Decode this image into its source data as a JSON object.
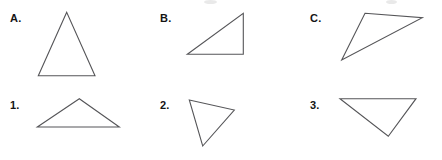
{
  "page": {
    "background_color": "#ffffff",
    "width": 442,
    "height": 160
  },
  "style": {
    "stroke_color": "#555558",
    "label_color": "#141414",
    "stroke_width": 1.1
  },
  "labels": {
    "a": "A.",
    "b": "B.",
    "c": "C.",
    "one": "1.",
    "two": "2.",
    "three": "3."
  },
  "figures": [
    {
      "id": "A",
      "label": "A.",
      "label_pos": [
        10,
        13
      ],
      "shape": "triangle",
      "description": "tall isosceles triangle, apex up",
      "points": "66.7,12.3 38.3,75.7 95,75.7"
    },
    {
      "id": "B",
      "label": "B.",
      "label_pos": [
        160,
        13
      ],
      "shape": "triangle",
      "description": "right triangle, right angle at bottom right",
      "points": "243.3,13.3 243.3,54.3 187.3,54.3"
    },
    {
      "id": "C",
      "label": "C.",
      "label_pos": [
        310,
        13
      ],
      "shape": "triangle",
      "description": "thin obtuse scalene triangle pointing down-left",
      "points": "365,13.3 422.3,17.7 341.7,60"
    },
    {
      "id": "1",
      "label": "1.",
      "label_pos": [
        10,
        100
      ],
      "shape": "triangle",
      "description": "wide flat isosceles triangle, apex up",
      "points": "79.3,98.7 37.3,127 119.3,127"
    },
    {
      "id": "2",
      "label": "2.",
      "label_pos": [
        160,
        100
      ],
      "shape": "triangle",
      "description": "scalene triangle rotated, vertex pointing down",
      "points": "189.3,100 234.3,110 202.7,146"
    },
    {
      "id": "3",
      "label": "3.",
      "label_pos": [
        310,
        100
      ],
      "shape": "triangle",
      "description": "wide triangle pointing down",
      "points": "340,98.7 416,98.7 388.3,136.3"
    }
  ]
}
